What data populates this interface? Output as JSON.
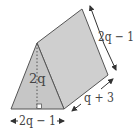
{
  "figure": {
    "type": "triangular-prism",
    "labels": {
      "height": "2q",
      "base": "2q − 1",
      "slant_edge": "2q − 1",
      "length": "q + 3"
    },
    "right_angle_marker": true,
    "colors": {
      "face_front": "#c8c8c8",
      "face_side": "#cfcfcf",
      "edge": "#555555",
      "text": "#444444"
    }
  }
}
